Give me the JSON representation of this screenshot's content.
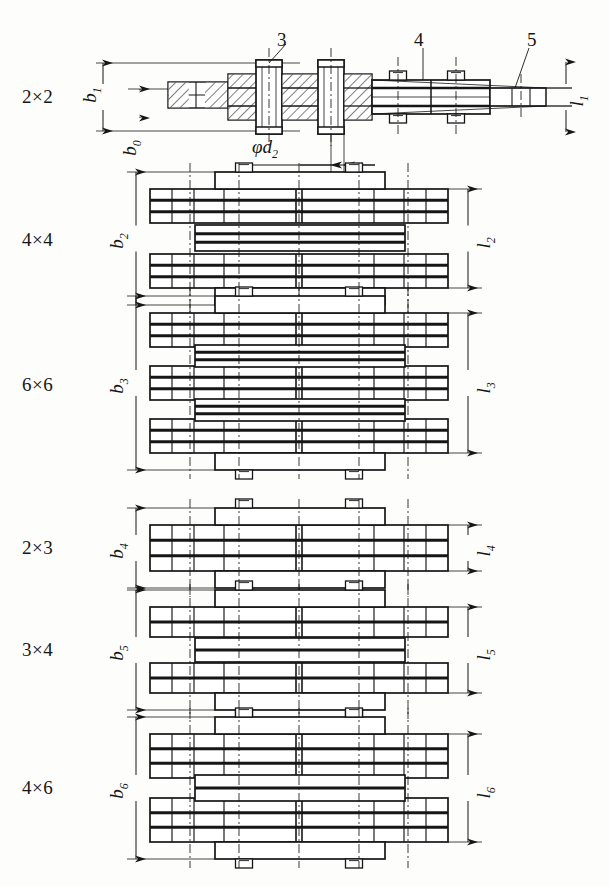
{
  "figure": {
    "kind": "engineering-drawing",
    "background": "#fdfdfb",
    "ink": "#161616"
  },
  "callouts": [
    {
      "id": "c3",
      "label": "3",
      "x": 283,
      "y": 40
    },
    {
      "id": "c4",
      "label": "4",
      "x": 419,
      "y": 40
    },
    {
      "id": "c5",
      "label": "5",
      "x": 532,
      "y": 40
    }
  ],
  "dimension_phi": {
    "label": "φd",
    "sub": "2",
    "x": 252,
    "y": 148
  },
  "rows": [
    {
      "id": "row-2x2",
      "combination": "2×2",
      "b_label": "b",
      "b_sub": "1",
      "l_label": "l",
      "l_sub": "1",
      "extra_label": "b",
      "extra_sub": "0",
      "label_x": 22,
      "label_y": 97,
      "b_x": 92,
      "b_y": 92,
      "b0_x": 133,
      "b0_y": 146,
      "l_x": 578,
      "l_y": 98,
      "y_center": 97,
      "outer_groups": 1,
      "view": "sectioned"
    },
    {
      "id": "row-4x4",
      "combination": "4×4",
      "b_label": "b",
      "b_sub": "2",
      "l_label": "l",
      "l_sub": "2",
      "label_x": 22,
      "label_y": 240,
      "b_x": 119,
      "b_y": 238,
      "l_x": 487,
      "l_y": 240,
      "y_center": 238,
      "outer_groups": 2,
      "view": "plan"
    },
    {
      "id": "row-6x6",
      "combination": "6×6",
      "b_label": "b",
      "b_sub": "3",
      "l_label": "l",
      "l_sub": "3",
      "label_x": 22,
      "label_y": 385,
      "b_x": 119,
      "b_y": 383,
      "l_x": 487,
      "l_y": 385,
      "y_center": 383,
      "outer_groups": 3,
      "view": "plan"
    },
    {
      "id": "row-2x3",
      "combination": "2×3",
      "b_label": "b",
      "b_sub": "4",
      "l_label": "l",
      "l_sub": "4",
      "label_x": 22,
      "label_y": 548,
      "b_x": 119,
      "b_y": 548,
      "l_x": 487,
      "l_y": 548,
      "y_center": 548,
      "outer_groups": 1,
      "view": "plan"
    },
    {
      "id": "row-3x4",
      "combination": "3×4",
      "b_label": "b",
      "b_sub": "5",
      "l_label": "l",
      "l_sub": "5",
      "label_x": 22,
      "label_y": 652,
      "b_x": 119,
      "b_y": 650,
      "l_x": 487,
      "l_y": 652,
      "y_center": 650,
      "outer_groups": 2,
      "view": "plan"
    },
    {
      "id": "row-4x6",
      "combination": "4×6",
      "b_label": "b",
      "b_sub": "6",
      "l_label": "l",
      "l_sub": "6",
      "label_x": 22,
      "label_y": 790,
      "b_x": 119,
      "b_y": 788,
      "l_x": 487,
      "l_y": 790,
      "y_center": 788,
      "outer_groups": 2,
      "view": "plan"
    }
  ]
}
